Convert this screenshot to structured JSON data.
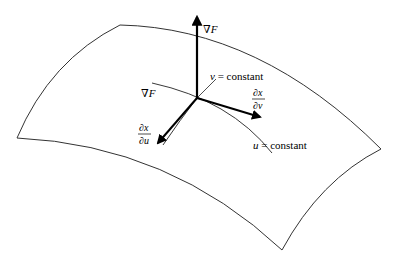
{
  "figure": {
    "colors": {
      "stroke": "#000000",
      "surface_edge": "#333333",
      "background": "#ffffff"
    },
    "surface": {
      "corners": {
        "top_left": [
          120,
          25
        ],
        "right": [
          381,
          149
        ],
        "bottom": [
          282,
          250
        ],
        "left": [
          17,
          138
        ]
      }
    },
    "origin": [
      197,
      98
    ],
    "labels": {
      "grad_top": {
        "nabla": "∇",
        "var": "F"
      },
      "grad_left": {
        "nabla": "∇",
        "var": "F"
      },
      "v_curve": {
        "var": "v",
        "eq": " = constant"
      },
      "u_curve": {
        "var": "u",
        "eq": " = constant"
      },
      "dxdv": {
        "num": "∂x",
        "den": "∂v"
      },
      "dxdu": {
        "num": "∂x",
        "den": "∂u"
      }
    }
  }
}
